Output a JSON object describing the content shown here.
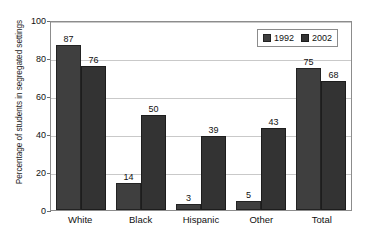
{
  "chart_data": {
    "type": "bar",
    "title": "",
    "xlabel": "",
    "ylabel": "Percentage of students in segregated settings",
    "categories": [
      "White",
      "Black",
      "Hispanic",
      "Other",
      "Total"
    ],
    "series": [
      {
        "name": "1992",
        "values": [
          87,
          14,
          3,
          5,
          75
        ],
        "color": "#3f3f3f"
      },
      {
        "name": "2002",
        "values": [
          76,
          50,
          39,
          43,
          68
        ],
        "color": "#333333"
      }
    ],
    "ylim": [
      0,
      100
    ],
    "yticks": [
      0,
      20,
      40,
      60,
      80,
      100
    ],
    "grid": true,
    "legend_position": "top-right",
    "data_labels": true
  }
}
